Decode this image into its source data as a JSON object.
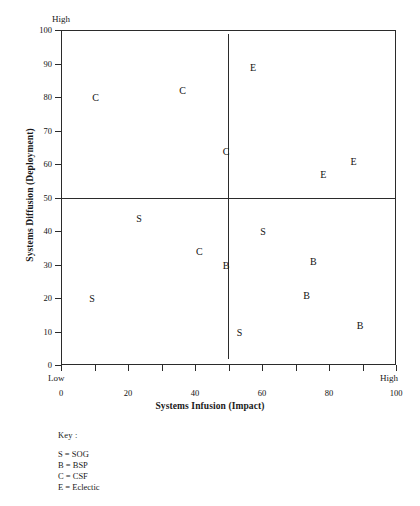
{
  "chart_data": {
    "type": "scatter",
    "title": "",
    "xlabel": "Systems Infusion (Impact)",
    "ylabel": "Systems Diffusion (Deployment)",
    "xlim": [
      0,
      100
    ],
    "ylim": [
      0,
      100
    ],
    "grid": false,
    "x_ticks": [
      0,
      10,
      20,
      30,
      40,
      50,
      60,
      70,
      80,
      90,
      100
    ],
    "x_tick_labels": [
      "0",
      "",
      "20",
      "",
      "40",
      "",
      "60",
      "",
      "80",
      "",
      "100"
    ],
    "y_ticks": [
      0,
      10,
      20,
      30,
      40,
      50,
      60,
      70,
      80,
      90,
      100
    ],
    "y_tick_labels": [
      "0",
      "10",
      "20",
      "30",
      "40",
      "50",
      "60",
      "70",
      "80",
      "90",
      "100"
    ],
    "axis_anchors": {
      "y_high": "High",
      "x_low": "Low",
      "x_high": "High"
    },
    "quadrant_lines": {
      "vertical_x": 50,
      "horizontal_y": 50
    },
    "legend_position": "below-left",
    "points": [
      {
        "label": "C",
        "x": 10,
        "y": 80
      },
      {
        "label": "C",
        "x": 36,
        "y": 82
      },
      {
        "label": "C",
        "x": 49,
        "y": 64
      },
      {
        "label": "C",
        "x": 41,
        "y": 34
      },
      {
        "label": "E",
        "x": 57,
        "y": 89
      },
      {
        "label": "E",
        "x": 78,
        "y": 57
      },
      {
        "label": "E",
        "x": 87,
        "y": 61
      },
      {
        "label": "S",
        "x": 23,
        "y": 44
      },
      {
        "label": "S",
        "x": 60,
        "y": 40
      },
      {
        "label": "S",
        "x": 9,
        "y": 20
      },
      {
        "label": "S",
        "x": 53,
        "y": 10
      },
      {
        "label": "B",
        "x": 49,
        "y": 30
      },
      {
        "label": "B",
        "x": 75,
        "y": 31
      },
      {
        "label": "B",
        "x": 73,
        "y": 21
      },
      {
        "label": "B",
        "x": 89,
        "y": 12
      }
    ],
    "series": [
      {
        "name": "SOG",
        "code": "S",
        "values": [
          [
            23,
            44
          ],
          [
            60,
            40
          ],
          [
            9,
            20
          ],
          [
            53,
            10
          ]
        ]
      },
      {
        "name": "BSP",
        "code": "B",
        "values": [
          [
            49,
            30
          ],
          [
            75,
            31
          ],
          [
            73,
            21
          ],
          [
            89,
            12
          ]
        ]
      },
      {
        "name": "CSF",
        "code": "C",
        "values": [
          [
            10,
            80
          ],
          [
            36,
            82
          ],
          [
            49,
            64
          ],
          [
            41,
            34
          ]
        ]
      },
      {
        "name": "Eclectic",
        "code": "E",
        "values": [
          [
            57,
            89
          ],
          [
            78,
            57
          ],
          [
            87,
            61
          ]
        ]
      }
    ]
  },
  "legend": {
    "title": "Key :",
    "entries": [
      {
        "text": "S = SOG"
      },
      {
        "text": "B = BSP"
      },
      {
        "text": "C = CSF"
      },
      {
        "text": "E = Eclectic"
      }
    ]
  },
  "colors": {
    "axis": "#2b2b2b",
    "text": "#111111",
    "background": "#ffffff"
  }
}
